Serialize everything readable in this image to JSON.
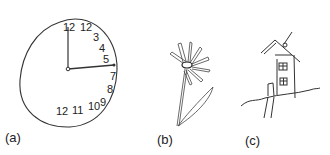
{
  "figure": {
    "panels": [
      {
        "id": "a",
        "label": "(a)",
        "subject": "hand-drawn clock",
        "numbers_top_right": [
          "12",
          "12",
          "3",
          "4",
          "5",
          "7",
          "8"
        ],
        "numbers_bottom": [
          "12",
          "11",
          "10",
          "9"
        ]
      },
      {
        "id": "b",
        "label": "(b)",
        "subject": "hand-drawn flower"
      },
      {
        "id": "c",
        "label": "(c)",
        "subject": "hand-drawn house"
      }
    ]
  }
}
